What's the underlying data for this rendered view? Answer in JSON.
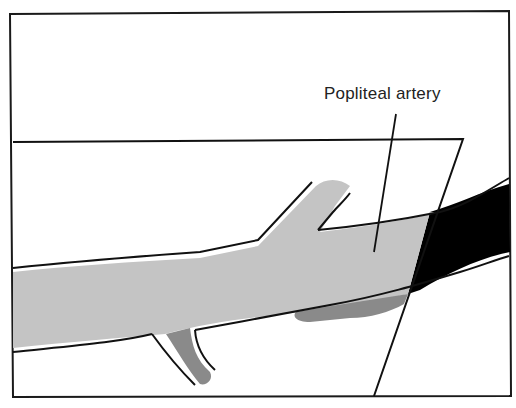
{
  "figure": {
    "type": "anatomical-diagram",
    "labels": {
      "popliteal_artery": "Popliteal artery"
    },
    "colors": {
      "frame": "#1a1a1a",
      "artery_fill": "#c4c4c4",
      "branch_fill": "#8a8a8a",
      "vein_fill": "#000000",
      "background": "#ffffff"
    }
  }
}
